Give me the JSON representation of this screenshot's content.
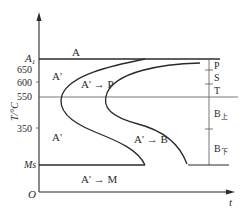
{
  "diagram": {
    "type": "TTT (isothermal transformation) C-curve diagram",
    "axes": {
      "y_label": "T/°C",
      "x_label": "t",
      "origin_label": "O",
      "y_ticks": [
        {
          "label": "A",
          "sub": "1",
          "role": "A1 critical temperature"
        },
        {
          "label": "650"
        },
        {
          "label": "600"
        },
        {
          "label": "550"
        },
        {
          "label": "350"
        },
        {
          "label": "Ms",
          "role": "martensite start"
        }
      ]
    },
    "regions": {
      "austenite_stable": "A",
      "undercooled_austenite_upper": "A'",
      "undercooled_austenite_lower": "A'",
      "pearlite_transform": "A' → P",
      "bainite_transform": "A' → B",
      "martensite_transform": "A' → M",
      "arrow_glyph": "→"
    },
    "right_scale": {
      "labels": [
        {
          "main": "P",
          "sub": ""
        },
        {
          "main": "S",
          "sub": ""
        },
        {
          "main": "T",
          "sub": ""
        },
        {
          "main": "B",
          "sub": "上"
        },
        {
          "main": "B",
          "sub": "下"
        }
      ]
    },
    "colors": {
      "line": "#2a2a2a",
      "background": "#ffffff"
    }
  }
}
